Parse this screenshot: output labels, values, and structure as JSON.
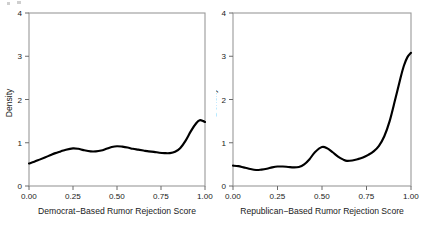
{
  "figure": {
    "background_color": "#ffffff",
    "curve_color": "#000000",
    "frame_color": "#9a9a9a",
    "width": 432,
    "height": 228
  },
  "chart_data": [
    {
      "type": "line",
      "panel": "left",
      "title": "",
      "xlabel": "Democrat−Based Rumor Rejection Score",
      "ylabel": "Density",
      "xlim": [
        0.0,
        1.0
      ],
      "ylim": [
        0.0,
        4.0
      ],
      "grid": false,
      "legend": "none",
      "xticks": [
        0.0,
        0.25,
        0.5,
        0.75,
        1.0
      ],
      "xticklabels": [
        "0.00",
        "0.25",
        "0.50",
        "0.75",
        "1.00"
      ],
      "yticks": [
        0,
        1,
        2,
        3,
        4
      ],
      "yticklabels": [
        "0",
        "1",
        "2",
        "3",
        "4"
      ],
      "x": [
        0.0,
        0.03,
        0.06,
        0.09,
        0.12,
        0.15,
        0.18,
        0.21,
        0.25,
        0.28,
        0.31,
        0.35,
        0.38,
        0.41,
        0.44,
        0.47,
        0.5,
        0.53,
        0.56,
        0.59,
        0.62,
        0.65,
        0.68,
        0.71,
        0.74,
        0.77,
        0.8,
        0.83,
        0.86,
        0.89,
        0.92,
        0.95,
        0.97,
        0.99,
        1.0
      ],
      "y": [
        0.52,
        0.56,
        0.61,
        0.66,
        0.71,
        0.76,
        0.8,
        0.84,
        0.87,
        0.86,
        0.83,
        0.8,
        0.8,
        0.82,
        0.86,
        0.9,
        0.92,
        0.91,
        0.89,
        0.86,
        0.84,
        0.82,
        0.8,
        0.79,
        0.77,
        0.76,
        0.76,
        0.79,
        0.88,
        1.05,
        1.27,
        1.45,
        1.52,
        1.5,
        1.48
      ]
    },
    {
      "type": "line",
      "panel": "right",
      "title": "",
      "xlabel": "Republican−Based Rumor Rejection Score",
      "ylabel": "Density",
      "xlim": [
        0.0,
        1.0
      ],
      "ylim": [
        0.0,
        4.0
      ],
      "grid": false,
      "legend": "none",
      "xticks": [
        0.0,
        0.25,
        0.5,
        0.75,
        1.0
      ],
      "xticklabels": [
        "0.00",
        "0.25",
        "0.50",
        "0.75",
        "1.00"
      ],
      "yticks": [
        0,
        1,
        2,
        3,
        4
      ],
      "yticklabels": [
        "0",
        "1",
        "2",
        "3",
        "4"
      ],
      "x": [
        0.0,
        0.03,
        0.06,
        0.09,
        0.13,
        0.16,
        0.19,
        0.22,
        0.25,
        0.28,
        0.31,
        0.34,
        0.37,
        0.4,
        0.43,
        0.46,
        0.5,
        0.53,
        0.56,
        0.59,
        0.62,
        0.64,
        0.67,
        0.7,
        0.73,
        0.76,
        0.79,
        0.82,
        0.85,
        0.88,
        0.91,
        0.94,
        0.96,
        0.98,
        1.0
      ],
      "y": [
        0.47,
        0.46,
        0.43,
        0.4,
        0.37,
        0.38,
        0.4,
        0.43,
        0.45,
        0.45,
        0.44,
        0.43,
        0.44,
        0.5,
        0.62,
        0.78,
        0.9,
        0.87,
        0.78,
        0.68,
        0.61,
        0.58,
        0.59,
        0.62,
        0.66,
        0.72,
        0.8,
        0.93,
        1.15,
        1.5,
        1.98,
        2.48,
        2.78,
        2.98,
        3.08
      ]
    }
  ]
}
